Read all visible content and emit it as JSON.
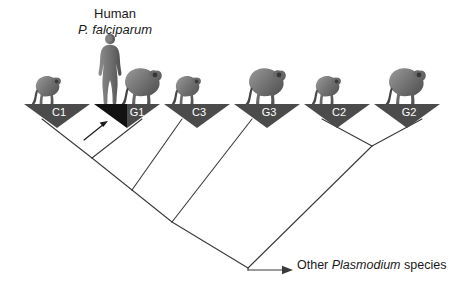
{
  "figure": {
    "type": "cladogram",
    "host_label": {
      "common_name": "Human",
      "parasite_species": "P. falciparum"
    },
    "root_label": {
      "prefix": "Other ",
      "genus": "Plasmodium",
      "suffix": " species"
    },
    "colors": {
      "clade_fill": "#4b4b4b",
      "clade_fill_highlight": "#121212",
      "branch_stroke": "#3a3a3a",
      "text_dark": "#1a1a1a",
      "clade_label_text": "#ffffff",
      "silhouette_dark": "#595959",
      "silhouette_mid": "#7d7d7d",
      "silhouette_light": "#a3a3a3"
    },
    "clades": [
      {
        "id": "C1",
        "label": "C1",
        "host": "chimpanzee",
        "x": 57,
        "highlighted": false
      },
      {
        "id": "G1",
        "label": "G1",
        "host": "gorilla",
        "x": 127,
        "highlighted": true
      },
      {
        "id": "C3",
        "label": "C3",
        "host": "chimpanzee",
        "x": 197,
        "highlighted": false
      },
      {
        "id": "G3",
        "label": "G3",
        "host": "gorilla",
        "x": 267,
        "highlighted": false
      },
      {
        "id": "C2",
        "label": "C2",
        "host": "chimpanzee",
        "x": 337,
        "highlighted": false
      },
      {
        "id": "G2",
        "label": "G2",
        "host": "gorilla",
        "x": 407,
        "highlighted": false
      }
    ],
    "annotation": {
      "arrow_name": "falciparum-lineage-arrow",
      "points_to": "G1"
    }
  }
}
